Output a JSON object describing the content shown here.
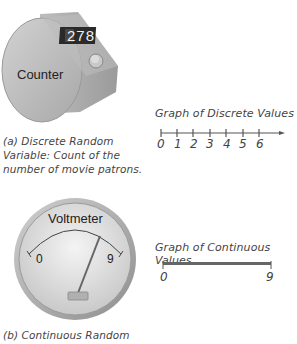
{
  "counter": {
    "display": "278",
    "label": "Counter",
    "caption_lines": [
      "(a) Discrete Random",
      "Variable: Count of the",
      "number of movie patrons."
    ]
  },
  "discrete_graph": {
    "title": "Graph of Discrete Values",
    "ticks": [
      "0",
      "1",
      "2",
      "3",
      "4",
      "5",
      "6"
    ]
  },
  "voltmeter": {
    "label": "Voltmeter",
    "min_label": "0",
    "max_label": "9",
    "caption_lines": [
      "(b) Continuous Random"
    ]
  },
  "continuous_graph": {
    "title": "Graph of Continuous Values",
    "min_label": "0",
    "max_label": "9"
  },
  "colors": {
    "device_gray": "#b9b9b9",
    "device_dark": "#8a8a8a",
    "display_bg": "#2a2a2a",
    "line": "#555555"
  }
}
